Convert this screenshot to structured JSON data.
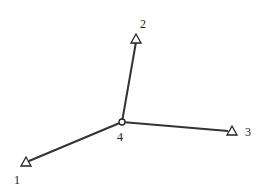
{
  "diagram": {
    "title": "",
    "colors": {
      "line": "#333333",
      "stroke": "#222222",
      "background": "#ffffff"
    },
    "nodes": [
      {
        "id": "1",
        "label": "1",
        "shape": "triangle",
        "x": 26,
        "y": 162,
        "label_x": 14,
        "label_y": 184
      },
      {
        "id": "2",
        "label": "2",
        "shape": "triangle",
        "x": 136,
        "y": 39,
        "label_x": 140,
        "label_y": 28
      },
      {
        "id": "3",
        "label": "3",
        "shape": "triangle",
        "x": 232,
        "y": 131,
        "label_x": 245,
        "label_y": 136
      },
      {
        "id": "4",
        "label": "4",
        "shape": "circle",
        "x": 122,
        "y": 122,
        "label_x": 117,
        "label_y": 141
      }
    ],
    "edges": [
      {
        "from": "4",
        "to": "1"
      },
      {
        "from": "4",
        "to": "2"
      },
      {
        "from": "4",
        "to": "3"
      }
    ]
  }
}
